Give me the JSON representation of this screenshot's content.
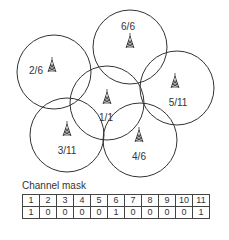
{
  "cells": [
    {
      "label": "6/6",
      "cx": 130,
      "cy": 47,
      "r": 37,
      "lx": 128,
      "ly": 30,
      "tx": 130,
      "ty": 42
    },
    {
      "label": "2/6",
      "cx": 54,
      "cy": 72,
      "r": 37,
      "lx": 36,
      "ly": 74,
      "tx": 52,
      "ty": 66
    },
    {
      "label": "5/11",
      "cx": 177,
      "cy": 88,
      "r": 37,
      "lx": 178,
      "ly": 106,
      "tx": 175,
      "ty": 82
    },
    {
      "label": "1/1",
      "cx": 107,
      "cy": 103,
      "r": 37,
      "lx": 106,
      "ly": 121,
      "tx": 107,
      "ty": 98
    },
    {
      "label": "3/11",
      "cx": 67,
      "cy": 135,
      "r": 37,
      "lx": 67,
      "ly": 154,
      "tx": 67,
      "ty": 130
    },
    {
      "label": "4/6",
      "cx": 140,
      "cy": 140,
      "r": 37,
      "lx": 139,
      "ly": 160,
      "tx": 139,
      "ty": 136
    }
  ],
  "caption": "Channel mask",
  "mask": {
    "channels": [
      "1",
      "2",
      "3",
      "4",
      "5",
      "6",
      "7",
      "8",
      "9",
      "10",
      "11"
    ],
    "values": [
      "1",
      "0",
      "0",
      "0",
      "0",
      "1",
      "0",
      "0",
      "0",
      "0",
      "1"
    ]
  }
}
